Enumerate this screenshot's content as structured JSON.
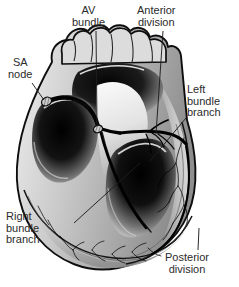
{
  "figure": {
    "style": "grayscale halftone medical illustration",
    "background_color": "#ffffff",
    "outline_color": "#111111",
    "wall_light": "#e2e2e2",
    "wall_mid": "#9d9d9d",
    "cavity_dark": "#0d0d0d",
    "conduction_color": "#000000"
  },
  "labels": {
    "sa_node": {
      "text": "SA\nnode",
      "lines": [
        "SA",
        "node"
      ]
    },
    "av_bundle": {
      "text": "AV\nbundle",
      "lines": [
        "AV",
        "bundle"
      ]
    },
    "anterior_division": {
      "text": "Anterior\ndivision",
      "lines": [
        "Anterior",
        "division"
      ]
    },
    "left_bundle": {
      "text": "Left\nbundle\nbranch",
      "lines": [
        "Left",
        "bundle",
        "branch"
      ]
    },
    "right_bundle": {
      "text": "Right\nbundle\nbranch",
      "lines": [
        "Right",
        "bundle",
        "branch"
      ]
    },
    "posterior_division": {
      "text": "Posterior\ndivision",
      "lines": [
        "Posterior",
        "division"
      ]
    }
  },
  "structures": [
    {
      "name": "sinoatrial-node",
      "kind": "node",
      "note": "small hatched oval, right atrial wall"
    },
    {
      "name": "atrioventricular-node",
      "kind": "node",
      "note": "small hatched oval at septal junction"
    },
    {
      "name": "av-bundle",
      "kind": "tract",
      "note": "bundle of His descending into septum"
    },
    {
      "name": "right-bundle-branch",
      "kind": "tract",
      "note": "runs down right side of septum to apex"
    },
    {
      "name": "left-bundle-branch",
      "kind": "tract",
      "note": "fans across left septal surface"
    },
    {
      "name": "anterior-division",
      "kind": "fascicle",
      "note": "anterior fascicle of left bundle"
    },
    {
      "name": "posterior-division",
      "kind": "fascicle",
      "note": "posterior fascicle of left bundle"
    },
    {
      "name": "purkinje-network",
      "kind": "network",
      "note": "fine branching fibers along ventricular walls"
    },
    {
      "name": "atrial-appendage",
      "kind": "chamber",
      "note": "scalloped lobes across the top"
    },
    {
      "name": "right-ventricle",
      "kind": "chamber",
      "note": "dark cavity, left of image"
    },
    {
      "name": "left-ventricle",
      "kind": "chamber",
      "note": "dark cavity, right of image"
    },
    {
      "name": "interventricular-septum",
      "kind": "wall",
      "note": "central pale wedge"
    }
  ]
}
